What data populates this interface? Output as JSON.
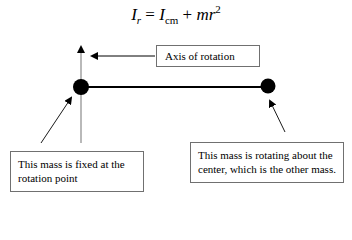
{
  "formula": {
    "lhs_symbol": "I",
    "lhs_subscript": "r",
    "equals": "=",
    "term1_symbol": "I",
    "term1_subscript": "cm",
    "plus": "+",
    "term2": "mr",
    "term2_exponent": "2"
  },
  "labels": {
    "axis": "Axis of rotation",
    "fixed_mass": "This mass is fixed at the rotation point",
    "rotating_mass": "This mass is rotating about the center, which is the other mass."
  },
  "colors": {
    "mass": "#000000",
    "rod": "#000000",
    "axis_line": "#8a8a8a",
    "box_border": "#707070"
  }
}
